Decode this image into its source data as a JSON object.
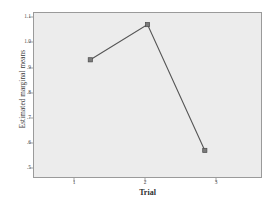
{
  "chart_data": {
    "type": "line",
    "title": "",
    "xlabel": "Trial",
    "ylabel": "Estimated marginal means",
    "categories": [
      "1",
      "2",
      "3"
    ],
    "values": [
      0.93,
      1.07,
      0.57
    ],
    "series": [
      {
        "name": "Estimated marginal means",
        "values": [
          0.93,
          1.07,
          0.57
        ]
      }
    ],
    "x_tick_labels": [
      "1",
      "2",
      "3"
    ],
    "y_tick_labels": [
      "1.1",
      "1.0",
      ".9",
      ".8",
      ".7",
      ".6",
      ".5"
    ],
    "y_tick_values": [
      1.1,
      1.0,
      0.9,
      0.8,
      0.7,
      0.6,
      0.5
    ],
    "ylim": [
      0.45,
      1.15
    ],
    "xlim": [
      0.5,
      3.5
    ],
    "grid": false,
    "legend": false,
    "marker": "square",
    "line_color": "#555555",
    "marker_color": "#555555",
    "panel_color": "#ececec",
    "frame_color": "#9a9a9a"
  }
}
